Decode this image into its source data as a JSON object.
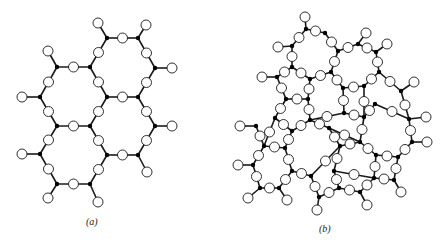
{
  "figure": {
    "panels": [
      {
        "id": "a",
        "caption": "(a)",
        "description": "Crystalline ordered network of hexagonal rings"
      },
      {
        "id": "b",
        "caption": "(b)",
        "description": "Random (amorphous/glassy) network of irregular rings"
      }
    ],
    "legend": {
      "cation": "black filled dot (bridging network-former atom)",
      "anion": "open circle (oxygen)"
    },
    "colors": {
      "stroke": "#1a1a1a",
      "fill_open": "#ffffff",
      "fill_dot": "#000000",
      "background": "#ffffff"
    }
  },
  "panel_a": {
    "si": [
      [
        57,
        67
      ],
      [
        90,
        67
      ],
      [
        107,
        38
      ],
      [
        138,
        38
      ],
      [
        155,
        68
      ],
      [
        40,
        97
      ],
      [
        107,
        97
      ],
      [
        138,
        97
      ],
      [
        57,
        126
      ],
      [
        90,
        126
      ],
      [
        155,
        126
      ],
      [
        40,
        154
      ],
      [
        107,
        155
      ],
      [
        138,
        155
      ],
      [
        57,
        184
      ],
      [
        90,
        184
      ]
    ],
    "bonds": [
      [
        0,
        1
      ],
      [
        1,
        2
      ],
      [
        2,
        3
      ],
      [
        3,
        4
      ],
      [
        4,
        7
      ],
      [
        7,
        6
      ],
      [
        6,
        1
      ],
      [
        0,
        5
      ],
      [
        5,
        8
      ],
      [
        8,
        9
      ],
      [
        9,
        6
      ],
      [
        7,
        10
      ],
      [
        10,
        13
      ],
      [
        13,
        12
      ],
      [
        12,
        9
      ],
      [
        8,
        11
      ],
      [
        11,
        14
      ],
      [
        14,
        15
      ],
      [
        15,
        12
      ]
    ],
    "terminals": [
      [
        0,
        48,
        51
      ],
      [
        2,
        98,
        23
      ],
      [
        3,
        146,
        25
      ],
      [
        4,
        172,
        68
      ],
      [
        5,
        22,
        97
      ],
      [
        10,
        172,
        126
      ],
      [
        11,
        22,
        154
      ],
      [
        13,
        147,
        172
      ],
      [
        14,
        48,
        198
      ],
      [
        15,
        98,
        202
      ]
    ]
  },
  "panel_b": {
    "si": [
      [
        85,
        29
      ],
      [
        104,
        33
      ],
      [
        71,
        46
      ],
      [
        117,
        51
      ],
      [
        137,
        44
      ],
      [
        155,
        52
      ],
      [
        71,
        67
      ],
      [
        56,
        77
      ],
      [
        89,
        79
      ],
      [
        110,
        72
      ],
      [
        158,
        72
      ],
      [
        143,
        86
      ],
      [
        122,
        88
      ],
      [
        65,
        99
      ],
      [
        87,
        99
      ],
      [
        154,
        104
      ],
      [
        180,
        91
      ],
      [
        188,
        119
      ],
      [
        54,
        118
      ],
      [
        89,
        120
      ],
      [
        123,
        113
      ],
      [
        143,
        117
      ],
      [
        35,
        126
      ],
      [
        71,
        131
      ],
      [
        108,
        128
      ],
      [
        139,
        142
      ],
      [
        191,
        142
      ],
      [
        43,
        146
      ],
      [
        64,
        148
      ],
      [
        119,
        146
      ],
      [
        155,
        155
      ],
      [
        177,
        157
      ],
      [
        32,
        165
      ],
      [
        71,
        171
      ],
      [
        90,
        176
      ],
      [
        113,
        171
      ],
      [
        153,
        178
      ],
      [
        173,
        180
      ],
      [
        39,
        188
      ],
      [
        58,
        188
      ],
      [
        98,
        197
      ],
      [
        118,
        188
      ],
      [
        139,
        192
      ]
    ],
    "bonds": [
      [
        0,
        1
      ],
      [
        0,
        2
      ],
      [
        1,
        3
      ],
      [
        3,
        4
      ],
      [
        4,
        5
      ],
      [
        2,
        6
      ],
      [
        6,
        7
      ],
      [
        6,
        8
      ],
      [
        8,
        9
      ],
      [
        9,
        3
      ],
      [
        9,
        12
      ],
      [
        5,
        10
      ],
      [
        10,
        11
      ],
      [
        11,
        12
      ],
      [
        10,
        16
      ],
      [
        7,
        13
      ],
      [
        13,
        14
      ],
      [
        14,
        8
      ],
      [
        12,
        20
      ],
      [
        14,
        19
      ],
      [
        19,
        20
      ],
      [
        20,
        21
      ],
      [
        21,
        11
      ],
      [
        16,
        17
      ],
      [
        15,
        21
      ],
      [
        15,
        17
      ],
      [
        13,
        18
      ],
      [
        18,
        23
      ],
      [
        23,
        19
      ],
      [
        19,
        24
      ],
      [
        24,
        25
      ],
      [
        25,
        21
      ],
      [
        17,
        26
      ],
      [
        22,
        27
      ],
      [
        18,
        27
      ],
      [
        27,
        28
      ],
      [
        28,
        23
      ],
      [
        24,
        29
      ],
      [
        29,
        25
      ],
      [
        25,
        30
      ],
      [
        30,
        31
      ],
      [
        31,
        26
      ],
      [
        27,
        32
      ],
      [
        28,
        33
      ],
      [
        33,
        34
      ],
      [
        34,
        29
      ],
      [
        29,
        35
      ],
      [
        35,
        36
      ],
      [
        36,
        30
      ],
      [
        36,
        37
      ],
      [
        37,
        31
      ],
      [
        32,
        38
      ],
      [
        38,
        39
      ],
      [
        39,
        33
      ],
      [
        34,
        40
      ],
      [
        40,
        41
      ],
      [
        41,
        35
      ],
      [
        41,
        42
      ],
      [
        42,
        36
      ]
    ],
    "terminals": [
      [
        0,
        84,
        17
      ],
      [
        2,
        57,
        47
      ],
      [
        4,
        145,
        33
      ],
      [
        5,
        166,
        44
      ],
      [
        7,
        41,
        77
      ],
      [
        16,
        193,
        82
      ],
      [
        22,
        19,
        126
      ],
      [
        26,
        206,
        142
      ],
      [
        17,
        205,
        117
      ],
      [
        32,
        17,
        165
      ],
      [
        38,
        27,
        198
      ],
      [
        39,
        66,
        200
      ],
      [
        37,
        180,
        192
      ],
      [
        40,
        96,
        210
      ],
      [
        42,
        146,
        205
      ]
    ]
  }
}
